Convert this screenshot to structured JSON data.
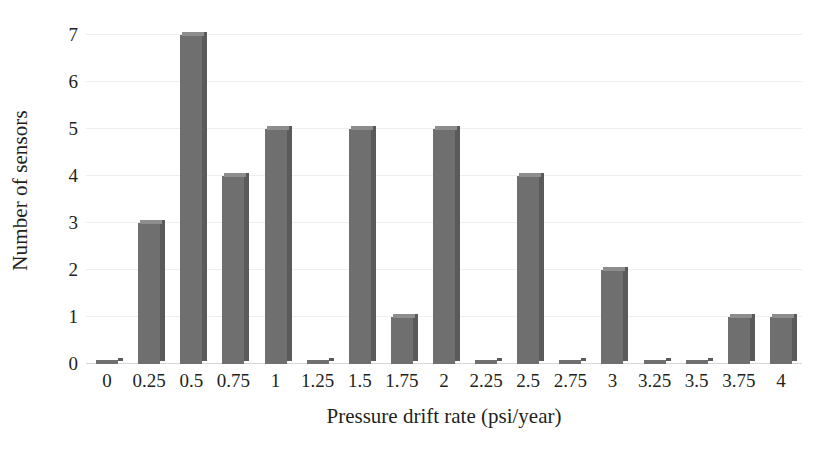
{
  "chart_data": {
    "type": "bar",
    "title": "",
    "subtitle": "",
    "xlabel": "Pressure drift rate (psi/year)",
    "ylabel": "Number of sensors",
    "categories": [
      "0",
      "0.25",
      "0.5",
      "0.75",
      "1",
      "1.25",
      "1.5",
      "1.75",
      "2",
      "2.25",
      "2.5",
      "2.75",
      "3",
      "3.25",
      "3.5",
      "3.75",
      "4"
    ],
    "values": [
      0,
      3,
      7,
      4,
      5,
      0,
      5,
      1,
      5,
      0,
      4,
      0,
      2,
      0,
      0,
      1,
      1
    ],
    "ylim": [
      0,
      7
    ],
    "y_ticks": [
      "0",
      "1",
      "2",
      "3",
      "4",
      "5",
      "6",
      "7"
    ],
    "y_tick_values": [
      0,
      1,
      2,
      3,
      4,
      5,
      6,
      7
    ],
    "grid": true,
    "grid_axis": "y",
    "legend": false,
    "legend_position": "none",
    "bar_style": "3d",
    "colors": {
      "bar_front": "#6f6f6f",
      "bar_side": "#5a5a5a",
      "bar_top": "#8d8d8d",
      "gridline": "#f1eeee",
      "baseline": "#d9d6d4",
      "text": "#231f20",
      "background": "#ffffff"
    }
  }
}
